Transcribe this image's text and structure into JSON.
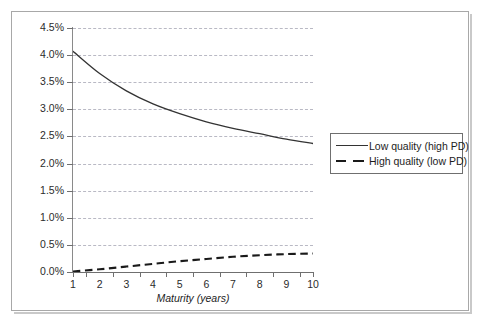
{
  "chart_data": {
    "type": "line",
    "title": "",
    "xlabel": "Maturity (years)",
    "ylabel": "Spreads",
    "categories": [
      1,
      2,
      3,
      4,
      5,
      6,
      7,
      8,
      9,
      10
    ],
    "x_tick_labels": [
      "1",
      "2",
      "3",
      "4",
      "5",
      "6",
      "7",
      "8",
      "9",
      "10"
    ],
    "y_tick_labels": [
      "0.0%",
      "0.5%",
      "1.0%",
      "1.5%",
      "2.0%",
      "2.5%",
      "3.0%",
      "3.5%",
      "4.0%",
      "4.5%"
    ],
    "y_tick_values": [
      0.0,
      0.5,
      1.0,
      1.5,
      2.0,
      2.5,
      3.0,
      3.5,
      4.0,
      4.5
    ],
    "ylim": [
      0.0,
      4.5
    ],
    "xlim": [
      1,
      10
    ],
    "grid": "horizontal-dashed",
    "legend_position": "right-middle",
    "series": [
      {
        "name": "Low quality (high PD)",
        "style": "solid",
        "color": "#333333",
        "values": [
          4.07,
          3.66,
          3.34,
          3.1,
          2.92,
          2.77,
          2.65,
          2.55,
          2.45,
          2.37
        ]
      },
      {
        "name": "High quality (low PD)",
        "style": "dashed",
        "color": "#1a1a1a",
        "values": [
          0.01,
          0.05,
          0.1,
          0.15,
          0.2,
          0.24,
          0.28,
          0.31,
          0.33,
          0.34
        ]
      }
    ]
  },
  "legend": {
    "items": [
      {
        "label": "Low quality (high PD)",
        "style": "solid"
      },
      {
        "label": "High quality (low PD)",
        "style": "dashed"
      }
    ]
  },
  "axes": {
    "y_title": "Spreads",
    "x_title": "Maturity (years)"
  }
}
